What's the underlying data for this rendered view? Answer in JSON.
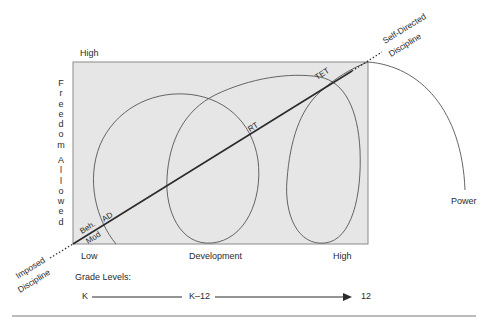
{
  "diagram": {
    "y_axis": {
      "top_label": "High",
      "title_line1": [
        "F",
        "r",
        "e",
        "e",
        "d",
        "o",
        "m"
      ],
      "title_line2": [
        "A",
        "l",
        "l",
        "o",
        "w",
        "e",
        "d"
      ]
    },
    "x_axis": {
      "low_label": "Low",
      "title": "Development",
      "high_label": "High"
    },
    "endpoints": {
      "imposed_line1": "Imposed",
      "imposed_line2": "Discipline",
      "self_directed_line1": "Self-Directed",
      "self_directed_line2": "Discipline"
    },
    "curve_labels": {
      "beh": "Beh.",
      "mod": "Mod",
      "ad": "AD",
      "rt": "RT",
      "tet": "TET",
      "power": "Power"
    },
    "grade_levels": {
      "title": "Grade Levels:",
      "start": "K",
      "middle": "K–12",
      "end": "12"
    },
    "colors": {
      "panel_fill": "#e6e6e6",
      "line": "#2b2b2b",
      "thin_line": "#555555"
    }
  }
}
